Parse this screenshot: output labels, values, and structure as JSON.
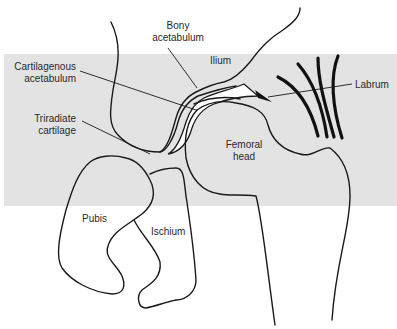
{
  "diagram": {
    "background_band_color": "#e3e3e3",
    "labels": {
      "bony_acetabulum": [
        "Bony",
        "acetabulum"
      ],
      "ilium": "Ilium",
      "cartilagenous_acetabulum": [
        "Cartilagenous",
        "acetabulum"
      ],
      "labrum": "Labrum",
      "triradiate_cartilage": [
        "Triradiate",
        "cartilage"
      ],
      "femoral_head": [
        "Femoral",
        "head"
      ],
      "pubis": "Pubis",
      "ischium": "Ischium"
    }
  }
}
